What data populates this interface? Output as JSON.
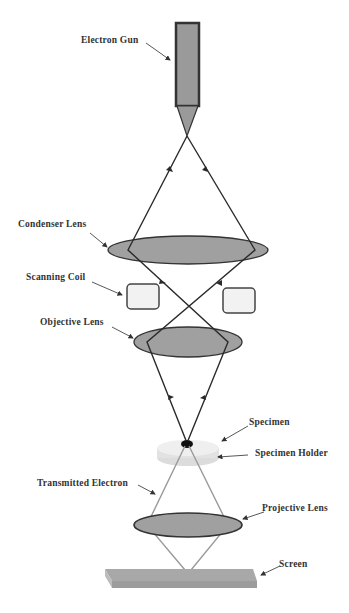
{
  "diagram": {
    "labels": {
      "electron_gun": "Electron Gun",
      "condenser_lens": "Condenser Lens",
      "scanning_coil": "Scanning Coil",
      "objective_lens": "Objective Lens",
      "specimen": "Specimen",
      "specimen_holder": "Specimen Holder",
      "transmitted_electron": "Transmitted Electron",
      "projective_lens": "Projective Lens",
      "screen": "Screen"
    },
    "colors": {
      "lens_fill": "#a0a0a0",
      "gun_fill": "#9a9a9a",
      "outline": "#333333",
      "beam": "#2a2a2a",
      "transmitted_beam": "#9a9a9a",
      "coil_fill": "#f2f2f2",
      "holder_fill": "#e8e8e8",
      "screen_fill": "#a8a8a8"
    }
  }
}
